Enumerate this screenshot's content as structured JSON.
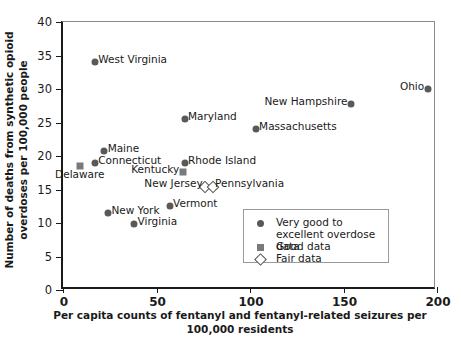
{
  "chart_data": {
    "type": "scatter",
    "title": "",
    "xlabel": "Per capita counts of fentanyl and fentanyl-related seizures per 100,000 residents",
    "ylabel": "Number of deaths from synthetic opioid overdoses per 100,000 people",
    "xlim": [
      0,
      200
    ],
    "ylim": [
      0,
      40
    ],
    "xticks": [
      "0",
      "50",
      "100",
      "150",
      "200"
    ],
    "yticks": [
      "0",
      "5",
      "10",
      "15",
      "20",
      "25",
      "30",
      "35",
      "40"
    ],
    "grid": false,
    "legend_position": "lower-right-inside",
    "points": [
      {
        "label": "West Virginia",
        "x": 17,
        "y": 34.0,
        "quality": "very-good",
        "label_side": "right"
      },
      {
        "label": "Ohio",
        "x": 195,
        "y": 30.0,
        "quality": "very-good",
        "label_side": "left"
      },
      {
        "label": "New Hampshire",
        "x": 154,
        "y": 27.8,
        "quality": "very-good",
        "label_side": "left"
      },
      {
        "label": "Maryland",
        "x": 65,
        "y": 25.5,
        "quality": "very-good",
        "label_side": "right"
      },
      {
        "label": "Massachusetts",
        "x": 103,
        "y": 24.0,
        "quality": "very-good",
        "label_side": "right"
      },
      {
        "label": "Maine",
        "x": 22,
        "y": 20.8,
        "quality": "very-good",
        "label_side": "right"
      },
      {
        "label": "Connecticut",
        "x": 17,
        "y": 19.0,
        "quality": "very-good",
        "label_side": "right"
      },
      {
        "label": "Rhode Island",
        "x": 65,
        "y": 19.0,
        "quality": "very-good",
        "label_side": "right"
      },
      {
        "label": "Delaware",
        "x": 9,
        "y": 18.5,
        "quality": "good",
        "label_side": "below"
      },
      {
        "label": "Kentucky",
        "x": 64,
        "y": 17.6,
        "quality": "good",
        "label_side": "left"
      },
      {
        "label": "New Jersey",
        "x": 76,
        "y": 15.3,
        "quality": "fair",
        "label_side": "left"
      },
      {
        "label": "Pennsylvania",
        "x": 80,
        "y": 15.3,
        "quality": "fair",
        "label_side": "right"
      },
      {
        "label": "Vermont",
        "x": 57,
        "y": 12.5,
        "quality": "very-good",
        "label_side": "right"
      },
      {
        "label": "New York",
        "x": 24,
        "y": 11.5,
        "quality": "very-good",
        "label_side": "right"
      },
      {
        "label": "Virginia",
        "x": 38,
        "y": 9.8,
        "quality": "very-good",
        "label_side": "right"
      }
    ],
    "legend": [
      {
        "marker": "circle",
        "label": "Very good to excellent overdose data"
      },
      {
        "marker": "square",
        "label": "Good data"
      },
      {
        "marker": "diamond",
        "label": "Fair data"
      }
    ],
    "colors": {
      "axis": "#1a1a1a",
      "marker_circle": "#595959",
      "marker_square": "#7a7a7a",
      "marker_diamond_edge": "#4d4d4d",
      "background": "#ffffff"
    }
  }
}
